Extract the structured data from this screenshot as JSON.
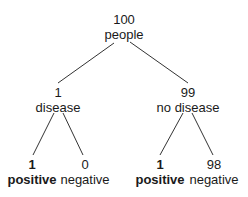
{
  "diagram": {
    "type": "tree",
    "root": {
      "count": "100",
      "label": "people"
    },
    "level1": [
      {
        "count": "1",
        "label": "disease"
      },
      {
        "count": "99",
        "label": "no disease"
      }
    ],
    "level2": [
      {
        "count": "1",
        "label": "positive",
        "bold": true
      },
      {
        "count": "0",
        "label": "negative",
        "bold": false
      },
      {
        "count": "1",
        "label": "positive",
        "bold": true
      },
      {
        "count": "98",
        "label": "negative",
        "bold": false
      }
    ],
    "colors": {
      "text": "#1a1a1a",
      "line": "#333333",
      "background": "#ffffff"
    }
  }
}
